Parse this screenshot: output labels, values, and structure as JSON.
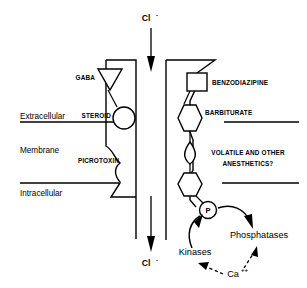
{
  "figure": {
    "ion_top": "Cl",
    "ion_top_charge": "-",
    "ion_bottom": "Cl",
    "ion_bottom_charge": "-",
    "compartments": {
      "extracellular": "Extracellular",
      "membrane": "Membrane",
      "intracellular": "Intracellular"
    },
    "binding_sites": {
      "gaba": "GABA",
      "steroid": "STEROID",
      "picrotoxin": "PICROTOXIN",
      "benzodiazipine": "BENZODIAZIPINE",
      "barbiturate": "BARBITURATE",
      "anesthetics_line1": "VOLATILE AND OTHER",
      "anesthetics_line2": "ANESTHETICS?"
    },
    "phosphorylation": {
      "phosphate": "P",
      "kinases": "Kinases",
      "phosphatases": "Phosphatases",
      "calcium": "Ca",
      "calcium_charge": "++"
    },
    "colors": {
      "ink": "#000000",
      "paper": "#ffffff"
    }
  }
}
